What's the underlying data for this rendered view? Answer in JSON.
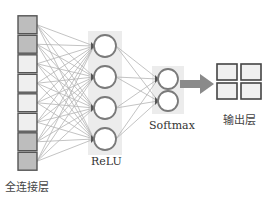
{
  "diagram": {
    "title": "",
    "colors": {
      "line": "#b4b4b4",
      "node_stroke": "#7a7a7a",
      "node_fill": "#ffffff",
      "panel_bg": "#ececec",
      "square_dark": "#bdbdbd",
      "square_light": "#efefef",
      "square_stroke": "#555555",
      "arrow": "#8a8a8a"
    },
    "layers": [
      {
        "id": "fc",
        "label": "全连接层",
        "kind": "squares",
        "count": 8,
        "shades": [
          "dark",
          "dark",
          "light",
          "light",
          "light",
          "light",
          "dark",
          "dark"
        ]
      },
      {
        "id": "relu",
        "label": "ReLU",
        "kind": "neurons",
        "count": 4
      },
      {
        "id": "softmax",
        "label": "Softmax",
        "kind": "neurons",
        "count": 2
      },
      {
        "id": "output",
        "label": "输出层",
        "kind": "grid",
        "rows": 2,
        "cols": 2
      }
    ],
    "edges": [
      {
        "from": "fc",
        "to": "relu",
        "type": "fully-connected"
      },
      {
        "from": "relu",
        "to": "softmax",
        "type": "fully-connected"
      },
      {
        "from": "softmax",
        "to": "output",
        "type": "arrow"
      }
    ]
  }
}
